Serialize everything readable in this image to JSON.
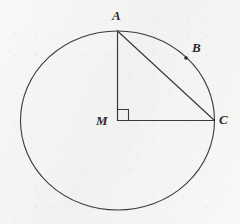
{
  "figure": {
    "background_color": "#f4f4f3",
    "stroke_color": "#3a3a3a",
    "label_color": "#2b2b2b",
    "circle": {
      "name": "circle-M",
      "center_x": 117.5,
      "center_y": 120.5,
      "radius_x": 97.0,
      "radius_y": 89.5
    },
    "points": [
      {
        "id": "A",
        "label": "A",
        "x": 117.5,
        "y": 31.0,
        "on_circle": true,
        "marker": false
      },
      {
        "id": "B",
        "label": "B",
        "x": 186.0,
        "y": 58.0,
        "on_circle": true,
        "marker": true
      },
      {
        "id": "M",
        "label": "M",
        "x": 117.5,
        "y": 120.5,
        "on_circle": false,
        "marker": false
      },
      {
        "id": "C",
        "label": "C",
        "x": 214.5,
        "y": 120.5,
        "on_circle": true,
        "marker": false
      }
    ],
    "segments": [
      {
        "name": "segment-AM",
        "from": "A",
        "to": "M",
        "x1": 117.5,
        "y1": 31.0,
        "x2": 117.5,
        "y2": 120.5
      },
      {
        "name": "segment-MC",
        "from": "M",
        "to": "C",
        "x1": 117.5,
        "y1": 120.5,
        "x2": 214.5,
        "y2": 120.5
      },
      {
        "name": "segment-AC",
        "from": "A",
        "to": "C",
        "x1": 117.5,
        "y1": 31.0,
        "x2": 214.5,
        "y2": 120.5
      }
    ],
    "right_angle_marker": {
      "name": "right-angle-marker-M",
      "vertex_x": 117.5,
      "vertex_y": 120.5,
      "size": 11,
      "at_point": "M",
      "measure_degrees": 90
    },
    "labels": {
      "A": "A",
      "B": "B",
      "M": "M",
      "C": "C"
    }
  }
}
